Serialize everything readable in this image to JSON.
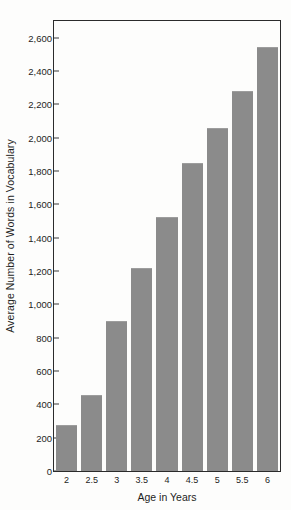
{
  "chart_data": {
    "type": "bar",
    "title": "",
    "xlabel": "Age in Years",
    "ylabel": "Average Number of Words in Vocabulary",
    "categories": [
      "2",
      "2.5",
      "3",
      "3.5",
      "4",
      "4.5",
      "5",
      "5.5",
      "6"
    ],
    "values": [
      270,
      450,
      895,
      1210,
      1520,
      1845,
      2050,
      2275,
      2540
    ],
    "ylim": [
      0,
      2700
    ],
    "xlim": [
      0,
      9
    ],
    "yticks": [
      0,
      200,
      400,
      600,
      800,
      1000,
      1200,
      1400,
      1600,
      1800,
      2000,
      2200,
      2400,
      2600
    ],
    "ytick_labels": [
      "0",
      "200",
      "400",
      "600",
      "800",
      "1,000",
      "1,200",
      "1,400",
      "1,600",
      "1,800",
      "2,000",
      "2,200",
      "2,400",
      "2,600"
    ],
    "grid": false,
    "legend": null,
    "legend_position": "none",
    "bar_color": "#8b8b8b",
    "axis_color": "#2b2b2b",
    "background_color": "#fdfdfc"
  }
}
